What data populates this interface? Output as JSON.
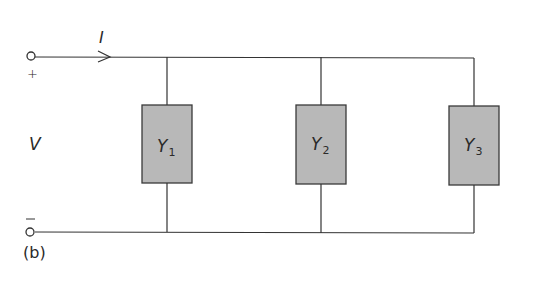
{
  "diagram": {
    "type": "parallel-admittance-circuit",
    "panel_label": "(b)",
    "current_label": "I",
    "voltage_label": "V",
    "terminals": {
      "positive_sign": "+",
      "negative_sign": "−"
    },
    "admittances": [
      {
        "symbol": "Y",
        "subscript": "1"
      },
      {
        "symbol": "Y",
        "subscript": "2"
      },
      {
        "symbol": "Y",
        "subscript": "3"
      }
    ],
    "colors": {
      "wire": "#333333",
      "box_fill": "#b8b8b8",
      "box_stroke": "#3a3a3a",
      "text": "#2a2a2a"
    }
  }
}
